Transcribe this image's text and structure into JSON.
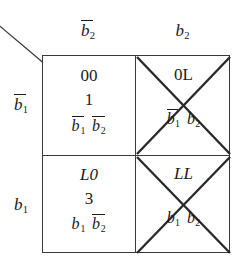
{
  "figure": {
    "type": "karnaugh-flow-table"
  },
  "headers": {
    "corner": {
      "icon": "diagonal-slash"
    },
    "columns": [
      {
        "id": "col-b2-bar",
        "base": "b",
        "sub": "2",
        "negated": true
      },
      {
        "id": "col-b2",
        "base": "b",
        "sub": "2",
        "negated": false
      }
    ],
    "rows": [
      {
        "id": "row-b1-bar",
        "base": "b",
        "sub": "1",
        "negated": true
      },
      {
        "id": "row-b1",
        "base": "b",
        "sub": "1",
        "negated": false
      }
    ]
  },
  "cells": [
    {
      "id": "cell-r0-c0",
      "row": 0,
      "col": 0,
      "crossed": false,
      "code": "00",
      "number": "1",
      "term": [
        {
          "base": "b",
          "sub": "1",
          "negated": true
        },
        {
          "base": "b",
          "sub": "2",
          "negated": true
        }
      ]
    },
    {
      "id": "cell-r0-c1",
      "row": 0,
      "col": 1,
      "crossed": true,
      "code": "0L",
      "number": "",
      "term": [
        {
          "base": "b",
          "sub": "1",
          "negated": true
        },
        {
          "base": "b",
          "sub": "2",
          "negated": false
        }
      ]
    },
    {
      "id": "cell-r1-c0",
      "row": 1,
      "col": 0,
      "crossed": false,
      "code": "L0",
      "number": "3",
      "term": [
        {
          "base": "b",
          "sub": "1",
          "negated": false
        },
        {
          "base": "b",
          "sub": "2",
          "negated": true
        }
      ]
    },
    {
      "id": "cell-r1-c1",
      "row": 1,
      "col": 1,
      "crossed": true,
      "code": "LL",
      "number": "",
      "term": [
        {
          "base": "b",
          "sub": "1",
          "negated": false
        },
        {
          "base": "b",
          "sub": "2",
          "negated": false
        }
      ]
    }
  ],
  "colors": {
    "ink": "#1a1a1a",
    "rule": "#3a3a3a",
    "background": "#ffffff"
  }
}
